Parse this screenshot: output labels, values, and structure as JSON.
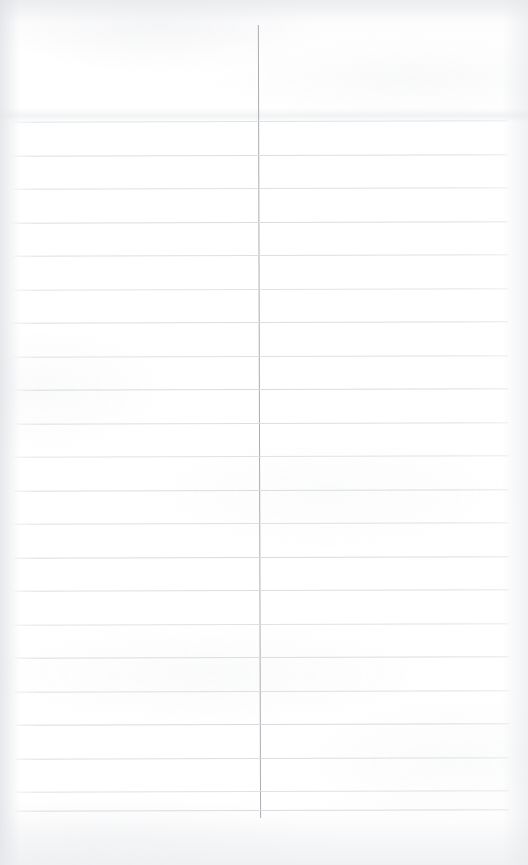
{
  "page": {
    "kind": "scanned-lined-notebook-page",
    "width": 528,
    "height": 865,
    "background_color": "#fdfdfd",
    "content_text": "",
    "is_blank": true
  },
  "ruling": {
    "horizontal_rule_color": "#d9dbde",
    "horizontal_rule_count": 21,
    "horizontal_rule_spacing_px": 33.5,
    "horizontal_first_y_px": 121,
    "horizontal_left_x_px": 14,
    "horizontal_right_x_px": 508,
    "horizontal_rule_thickness_px": 1,
    "skew_degrees": -0.16,
    "rule_ys": [
      121,
      154.5,
      188,
      221.5,
      255,
      288.5,
      322,
      355.5,
      389,
      422.5,
      456,
      489.5,
      523,
      556.5,
      590,
      623.5,
      657,
      690.5,
      724,
      757.5,
      791,
      810
    ],
    "margin_rule_color": "#a6a8ac",
    "margin_rule_x_px": 259,
    "margin_rule_top_y_px": 25,
    "margin_rule_bottom_y_px": 818,
    "margin_rule_thickness_px": 1
  }
}
